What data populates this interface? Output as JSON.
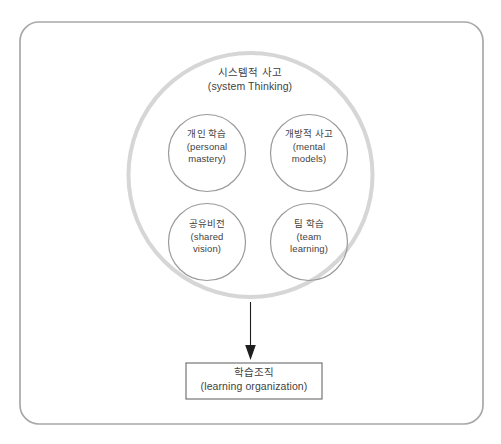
{
  "diagram": {
    "title_hidden": "",
    "outer_frame": {
      "name": "outer-frame",
      "stroke": "#a8a8a8"
    },
    "system_circle": {
      "ko": "시스템적 사고",
      "en": "(system Thinking)",
      "stroke": "#d6d6d6"
    },
    "disciplines": [
      {
        "id": "personal-mastery",
        "ko": "개인 학습",
        "en_line1": "(personal",
        "en_line2": "mastery)",
        "stroke": "#9a9a9a"
      },
      {
        "id": "mental-models",
        "ko": "개방적 사고",
        "en_line1": "(mental",
        "en_line2": "models)",
        "stroke": "#9a9a9a"
      },
      {
        "id": "shared-vision",
        "ko": "공유비전",
        "en_line1": "(shared",
        "en_line2": "vision)",
        "stroke": "#9a9a9a"
      },
      {
        "id": "team-learning",
        "ko": "팀 학습",
        "en_line1": "(team",
        "en_line2": "learning)",
        "stroke": "#9a9a9a"
      }
    ],
    "arrow": {
      "name": "down-arrow",
      "stroke": "#1e1e1e"
    },
    "result_box": {
      "ko": "학습조직",
      "en": "(learning organization)",
      "stroke": "#5a5a5a"
    },
    "text_color": "#3f3f3f"
  }
}
